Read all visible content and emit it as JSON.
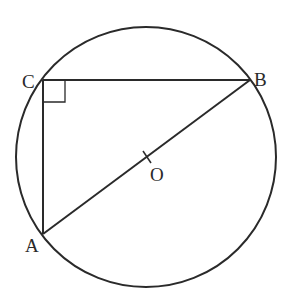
{
  "diagram": {
    "type": "geometry",
    "stroke_color": "#2a2a2a",
    "background": "#ffffff",
    "circle": {
      "center": "O",
      "cx": 146,
      "cy": 157,
      "r": 130
    },
    "points": [
      {
        "name": "A",
        "x": 43,
        "y": 234,
        "label": "A",
        "label_x": 24,
        "label_y": 250
      },
      {
        "name": "B",
        "x": 250,
        "y": 80,
        "label": "B",
        "label_x": 256,
        "label_y": 81
      },
      {
        "name": "C",
        "x": 43,
        "y": 80,
        "label": "C",
        "label_x": 22,
        "label_y": 81
      },
      {
        "name": "O",
        "x": 147,
        "y": 157,
        "label": "O",
        "label_x": 150,
        "label_y": 180
      }
    ],
    "segments": [
      "CB",
      "CA",
      "AB"
    ],
    "right_angle_marker": {
      "at": "C",
      "size": 22
    },
    "center_tick": {
      "at": "O"
    }
  }
}
